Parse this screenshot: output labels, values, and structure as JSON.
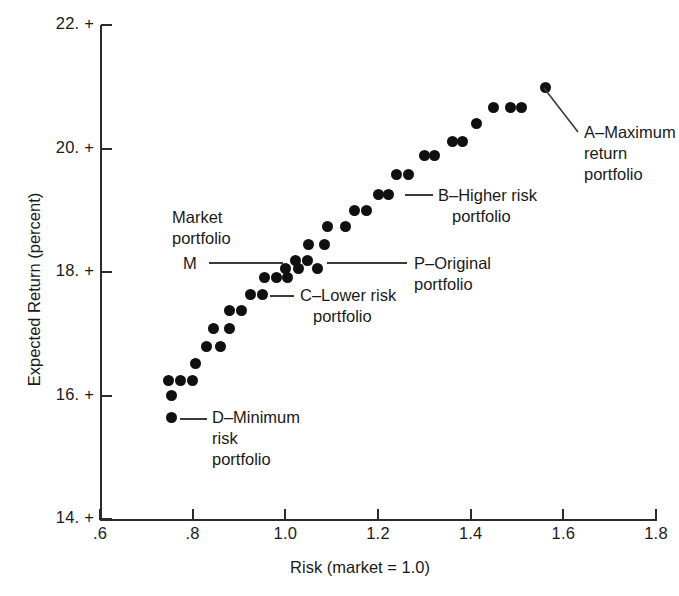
{
  "chart_data": {
    "type": "scatter",
    "title": "",
    "xlabel": "Risk (market = 1.0)",
    "ylabel": "Expected Return (percent)",
    "xlim": [
      0.6,
      1.8
    ],
    "ylim": [
      14.0,
      22.0
    ],
    "xticks": [
      ".6",
      ".8",
      "1.0",
      "1.2",
      "1.4",
      "1.6",
      "1.8"
    ],
    "yticks": [
      "14.",
      "16.",
      "18.",
      "20.",
      "22."
    ],
    "grid": false,
    "legend": "none",
    "marker": "filled-circle",
    "points": [
      {
        "x": 0.755,
        "y": 15.64,
        "label": "D"
      },
      {
        "x": 0.755,
        "y": 16.0,
        "label": ""
      },
      {
        "x": 0.748,
        "y": 16.24,
        "label": ""
      },
      {
        "x": 0.774,
        "y": 16.24,
        "label": ""
      },
      {
        "x": 0.8,
        "y": 16.24,
        "label": ""
      },
      {
        "x": 0.806,
        "y": 16.52,
        "label": ""
      },
      {
        "x": 0.83,
        "y": 16.79,
        "label": ""
      },
      {
        "x": 0.86,
        "y": 16.79,
        "label": ""
      },
      {
        "x": 0.845,
        "y": 17.08,
        "label": ""
      },
      {
        "x": 0.88,
        "y": 17.08,
        "label": ""
      },
      {
        "x": 0.88,
        "y": 17.37,
        "label": ""
      },
      {
        "x": 0.905,
        "y": 17.37,
        "label": ""
      },
      {
        "x": 0.925,
        "y": 17.63,
        "label": ""
      },
      {
        "x": 0.95,
        "y": 17.63,
        "label": ""
      },
      {
        "x": 0.955,
        "y": 17.91,
        "label": "C"
      },
      {
        "x": 0.98,
        "y": 17.91,
        "label": ""
      },
      {
        "x": 1.005,
        "y": 17.91,
        "label": ""
      },
      {
        "x": 1.022,
        "y": 18.18,
        "label": ""
      },
      {
        "x": 1.048,
        "y": 18.18,
        "label": ""
      },
      {
        "x": 1.0,
        "y": 18.06,
        "label": "M"
      },
      {
        "x": 1.028,
        "y": 18.06,
        "label": ""
      },
      {
        "x": 1.07,
        "y": 18.06,
        "label": "P"
      },
      {
        "x": 1.05,
        "y": 18.45,
        "label": ""
      },
      {
        "x": 1.085,
        "y": 18.45,
        "label": ""
      },
      {
        "x": 1.09,
        "y": 18.73,
        "label": ""
      },
      {
        "x": 1.13,
        "y": 18.73,
        "label": ""
      },
      {
        "x": 1.15,
        "y": 19.0,
        "label": ""
      },
      {
        "x": 1.175,
        "y": 19.0,
        "label": ""
      },
      {
        "x": 1.2,
        "y": 19.26,
        "label": "B"
      },
      {
        "x": 1.222,
        "y": 19.26,
        "label": ""
      },
      {
        "x": 1.24,
        "y": 19.58,
        "label": ""
      },
      {
        "x": 1.265,
        "y": 19.58,
        "label": ""
      },
      {
        "x": 1.3,
        "y": 19.88,
        "label": ""
      },
      {
        "x": 1.322,
        "y": 19.88,
        "label": ""
      },
      {
        "x": 1.36,
        "y": 20.12,
        "label": ""
      },
      {
        "x": 1.382,
        "y": 20.12,
        "label": ""
      },
      {
        "x": 1.412,
        "y": 20.4,
        "label": ""
      },
      {
        "x": 1.45,
        "y": 20.67,
        "label": ""
      },
      {
        "x": 1.487,
        "y": 20.67,
        "label": ""
      },
      {
        "x": 1.51,
        "y": 20.67,
        "label": ""
      },
      {
        "x": 1.562,
        "y": 20.99,
        "label": "A"
      }
    ],
    "annotations": [
      {
        "key": "market",
        "text": "Market\nportfolio",
        "point_label": "M",
        "marker_text": "M"
      },
      {
        "key": "d",
        "text": "D–Minimum\nrisk\nportfolio",
        "point_label": "D"
      },
      {
        "key": "c",
        "text": "C–Lower risk\nportfolio",
        "point_label": "C"
      },
      {
        "key": "p",
        "text": "P–Original\nportfolio",
        "point_label": "P"
      },
      {
        "key": "b",
        "text": "B–Higher risk\nportfolio",
        "point_label": "B"
      },
      {
        "key": "a",
        "text": "A–Maximum\nreturn\nportfolio",
        "point_label": "A"
      }
    ]
  },
  "labels": {
    "market_line1": "Market",
    "market_line2": "portfolio",
    "market_marker": "M",
    "d_line1": "D–Minimum",
    "d_line2": "risk",
    "d_line3": "portfolio",
    "c_line1": "C–Lower risk",
    "c_line2": "portfolio",
    "p_line1": "P–Original",
    "p_line2": "portfolio",
    "b_line1": "B–Higher risk",
    "b_line2": "portfolio",
    "a_line1": "A–Maximum",
    "a_line2": "return",
    "a_line3": "portfolio"
  },
  "colors": {
    "marker": "#101010",
    "axis": "#2b2b2b",
    "background": "#ffffff",
    "leader": "#3a3a3a"
  }
}
